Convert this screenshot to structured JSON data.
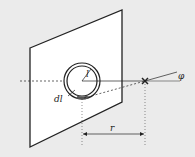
{
  "diagram": {
    "labels": {
      "radius": "l",
      "element": "dl",
      "distance": "r",
      "angle": "φ"
    },
    "colors": {
      "background": "#ebebeb",
      "plane": "#ffffff",
      "stroke": "#222222"
    }
  }
}
